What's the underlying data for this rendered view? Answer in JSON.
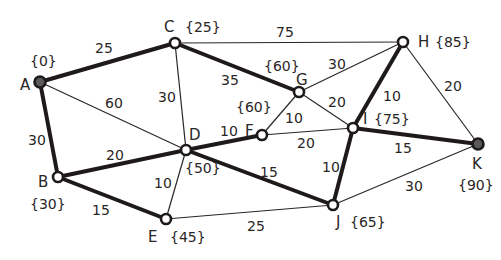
{
  "diagram": {
    "type": "weighted-graph",
    "colors": {
      "line": "#1e1a1a",
      "start_end_node_fill": "#5a5a5a",
      "node_fill": "#ffffff",
      "background": "#ffffff"
    },
    "nodes": [
      {
        "id": "A",
        "label": "A",
        "dist": "{0}",
        "x": 40,
        "y": 82,
        "filled": true,
        "lx": 20,
        "ly": 90,
        "dx": 30,
        "dy": 66
      },
      {
        "id": "B",
        "label": "B",
        "dist": "{30}",
        "x": 58,
        "y": 177,
        "filled": false,
        "lx": 38,
        "ly": 187,
        "dx": 30,
        "dy": 209
      },
      {
        "id": "C",
        "label": "C",
        "dist": "{25}",
        "x": 175,
        "y": 43,
        "filled": false,
        "lx": 164,
        "ly": 32,
        "dx": 185,
        "dy": 32
      },
      {
        "id": "D",
        "label": "D",
        "dist": "{50}",
        "x": 186,
        "y": 150,
        "filled": false,
        "lx": 189,
        "ly": 140,
        "dx": 185,
        "dy": 173
      },
      {
        "id": "E",
        "label": "E",
        "dist": "{45}",
        "x": 166,
        "y": 219,
        "filled": false,
        "lx": 148,
        "ly": 242,
        "dx": 170,
        "dy": 242
      },
      {
        "id": "F",
        "label": "F",
        "dist": "{60}",
        "x": 262,
        "y": 135,
        "filled": false,
        "lx": 245,
        "ly": 136,
        "dx": 236,
        "dy": 112
      },
      {
        "id": "G",
        "label": "G",
        "dist": "{60}",
        "x": 299,
        "y": 92,
        "filled": false,
        "lx": 296,
        "ly": 85,
        "dx": 264,
        "dy": 71
      },
      {
        "id": "H",
        "label": "H",
        "dist": "{85}",
        "x": 403,
        "y": 42,
        "filled": false,
        "lx": 418,
        "ly": 47,
        "dx": 435,
        "dy": 47
      },
      {
        "id": "I",
        "label": "I",
        "dist": "{75}",
        "x": 353,
        "y": 128,
        "filled": false,
        "lx": 363,
        "ly": 124,
        "dx": 374,
        "dy": 124
      },
      {
        "id": "J",
        "label": "J",
        "dist": "{65}",
        "x": 333,
        "y": 205,
        "filled": false,
        "lx": 336,
        "ly": 227,
        "dx": 350,
        "dy": 227
      },
      {
        "id": "K",
        "label": "K",
        "dist": "{90}",
        "x": 478,
        "y": 144,
        "filled": true,
        "lx": 472,
        "ly": 169,
        "dx": 458,
        "dy": 190
      }
    ],
    "edges": [
      {
        "from": "A",
        "to": "C",
        "weight": "25",
        "bold": true,
        "wx": 95,
        "wy": 53
      },
      {
        "from": "A",
        "to": "B",
        "weight": "30",
        "bold": true,
        "wx": 28,
        "wy": 145
      },
      {
        "from": "A",
        "to": "D",
        "weight": "60",
        "bold": false,
        "wx": 105,
        "wy": 108
      },
      {
        "from": "C",
        "to": "D",
        "weight": "30",
        "bold": false,
        "wx": 158,
        "wy": 102
      },
      {
        "from": "C",
        "to": "H",
        "weight": "75",
        "bold": false,
        "wx": 276,
        "wy": 37
      },
      {
        "from": "C",
        "to": "G",
        "weight": "35",
        "bold": true,
        "wx": 221,
        "wy": 85
      },
      {
        "from": "B",
        "to": "D",
        "weight": "20",
        "bold": true,
        "wx": 106,
        "wy": 160
      },
      {
        "from": "B",
        "to": "E",
        "weight": "15",
        "bold": true,
        "wx": 92,
        "wy": 215
      },
      {
        "from": "D",
        "to": "F",
        "weight": "10",
        "bold": true,
        "wx": 220,
        "wy": 136
      },
      {
        "from": "D",
        "to": "E",
        "weight": "10",
        "bold": false,
        "wx": 154,
        "wy": 188
      },
      {
        "from": "D",
        "to": "J",
        "weight": "15",
        "bold": true,
        "wx": 260,
        "wy": 177
      },
      {
        "from": "F",
        "to": "G",
        "weight": "10",
        "bold": false,
        "wx": 285,
        "wy": 123
      },
      {
        "from": "F",
        "to": "I",
        "weight": "20",
        "bold": false,
        "wx": 297,
        "wy": 148
      },
      {
        "from": "G",
        "to": "H",
        "weight": "30",
        "bold": false,
        "wx": 328,
        "wy": 69
      },
      {
        "from": "G",
        "to": "I",
        "weight": "20",
        "bold": false,
        "wx": 328,
        "wy": 107
      },
      {
        "from": "H",
        "to": "I",
        "weight": "10",
        "bold": true,
        "wx": 383,
        "wy": 101
      },
      {
        "from": "H",
        "to": "K",
        "weight": "20",
        "bold": false,
        "wx": 444,
        "wy": 91
      },
      {
        "from": "I",
        "to": "J",
        "weight": "10",
        "bold": true,
        "wx": 322,
        "wy": 172
      },
      {
        "from": "I",
        "to": "K",
        "weight": "15",
        "bold": true,
        "wx": 394,
        "wy": 153
      },
      {
        "from": "E",
        "to": "J",
        "weight": "25",
        "bold": false,
        "wx": 247,
        "wy": 231
      },
      {
        "from": "J",
        "to": "K",
        "weight": "30",
        "bold": false,
        "wx": 405,
        "wy": 191
      }
    ]
  }
}
